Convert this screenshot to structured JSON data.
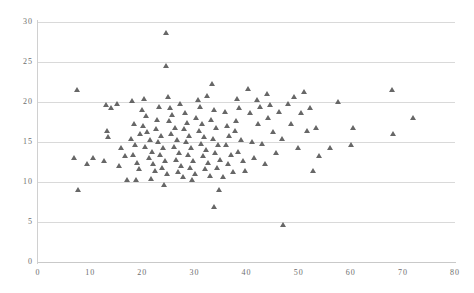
{
  "chart_data": {
    "type": "scatter",
    "title": "",
    "xlabel": "",
    "ylabel": "",
    "xlim": [
      0,
      80
    ],
    "ylim": [
      0,
      30
    ],
    "xticks": [
      0,
      10,
      20,
      30,
      40,
      50,
      60,
      70,
      80
    ],
    "yticks": [
      0,
      5,
      10,
      15,
      20,
      25,
      30
    ],
    "grid": "horizontal",
    "legend": "none",
    "marker": "triangle",
    "marker_color": "#5a5a5a",
    "gridline_color": "#d9d9d9",
    "axis_color": "#c9c9c9",
    "tick_label_color": "#6e6e6e",
    "series": [
      {
        "name": "observations",
        "points": [
          [
            7.5,
            21.5
          ],
          [
            7.0,
            13.0
          ],
          [
            9.4,
            12.3
          ],
          [
            10.6,
            13.0
          ],
          [
            7.6,
            9.0
          ],
          [
            13.0,
            19.6
          ],
          [
            14.0,
            19.2
          ],
          [
            13.2,
            16.4
          ],
          [
            13.4,
            15.6
          ],
          [
            12.6,
            12.6
          ],
          [
            15.2,
            19.8
          ],
          [
            16.0,
            14.2
          ],
          [
            16.6,
            13.2
          ],
          [
            15.6,
            12.0
          ],
          [
            17.0,
            10.2
          ],
          [
            18.0,
            20.1
          ],
          [
            18.4,
            17.2
          ],
          [
            17.8,
            15.4
          ],
          [
            18.6,
            14.6
          ],
          [
            18.2,
            13.4
          ],
          [
            19.0,
            12.4
          ],
          [
            19.4,
            11.6
          ],
          [
            18.8,
            10.2
          ],
          [
            19.6,
            16.0
          ],
          [
            20.0,
            19.0
          ],
          [
            20.4,
            20.4
          ],
          [
            20.8,
            18.2
          ],
          [
            20.2,
            17.0
          ],
          [
            21.0,
            16.2
          ],
          [
            21.4,
            15.2
          ],
          [
            20.6,
            14.4
          ],
          [
            21.8,
            13.8
          ],
          [
            21.2,
            13.0
          ],
          [
            22.0,
            12.2
          ],
          [
            22.4,
            11.4
          ],
          [
            21.6,
            10.4
          ],
          [
            22.8,
            17.8
          ],
          [
            23.2,
            19.4
          ],
          [
            22.6,
            16.6
          ],
          [
            23.6,
            15.8
          ],
          [
            23.0,
            15.0
          ],
          [
            24.0,
            14.2
          ],
          [
            23.4,
            13.4
          ],
          [
            24.4,
            12.6
          ],
          [
            23.8,
            11.8
          ],
          [
            24.8,
            11.0
          ],
          [
            24.2,
            9.6
          ],
          [
            24.6,
            28.6
          ],
          [
            24.6,
            24.5
          ],
          [
            25.0,
            20.6
          ],
          [
            25.4,
            19.2
          ],
          [
            25.8,
            18.4
          ],
          [
            25.2,
            17.6
          ],
          [
            26.2,
            16.8
          ],
          [
            25.6,
            16.0
          ],
          [
            26.6,
            15.2
          ],
          [
            26.0,
            14.4
          ],
          [
            27.0,
            13.6
          ],
          [
            26.4,
            12.8
          ],
          [
            27.4,
            12.0
          ],
          [
            26.8,
            11.2
          ],
          [
            27.8,
            10.6
          ],
          [
            27.2,
            19.8
          ],
          [
            28.2,
            18.6
          ],
          [
            28.6,
            17.4
          ],
          [
            28.0,
            16.6
          ],
          [
            29.0,
            15.8
          ],
          [
            28.4,
            15.0
          ],
          [
            29.4,
            14.2
          ],
          [
            28.8,
            13.4
          ],
          [
            29.8,
            12.6
          ],
          [
            29.2,
            11.8
          ],
          [
            30.2,
            11.0
          ],
          [
            29.6,
            10.2
          ],
          [
            30.6,
            20.3
          ],
          [
            31.0,
            19.4
          ],
          [
            30.4,
            18.0
          ],
          [
            31.4,
            17.2
          ],
          [
            30.8,
            16.4
          ],
          [
            31.8,
            15.6
          ],
          [
            31.2,
            14.8
          ],
          [
            32.2,
            14.0
          ],
          [
            31.6,
            13.2
          ],
          [
            32.6,
            12.4
          ],
          [
            32.0,
            11.6
          ],
          [
            33.0,
            10.8
          ],
          [
            32.4,
            20.8
          ],
          [
            33.4,
            22.2
          ],
          [
            33.8,
            19.0
          ],
          [
            33.2,
            17.8
          ],
          [
            34.2,
            16.8
          ],
          [
            33.6,
            15.4
          ],
          [
            34.6,
            14.6
          ],
          [
            34.0,
            13.6
          ],
          [
            35.0,
            12.8
          ],
          [
            34.4,
            11.8
          ],
          [
            35.4,
            10.6
          ],
          [
            34.8,
            9.0
          ],
          [
            33.8,
            6.9
          ],
          [
            35.8,
            18.8
          ],
          [
            36.2,
            17.0
          ],
          [
            36.6,
            15.8
          ],
          [
            36.0,
            14.6
          ],
          [
            37.0,
            13.4
          ],
          [
            36.4,
            12.2
          ],
          [
            37.4,
            11.2
          ],
          [
            37.8,
            16.4
          ],
          [
            38.2,
            20.4
          ],
          [
            38.6,
            19.2
          ],
          [
            38.0,
            17.6
          ],
          [
            39.0,
            15.2
          ],
          [
            38.4,
            13.8
          ],
          [
            39.4,
            12.6
          ],
          [
            39.8,
            11.4
          ],
          [
            40.2,
            21.6
          ],
          [
            40.6,
            18.6
          ],
          [
            41.0,
            15.0
          ],
          [
            41.4,
            13.0
          ],
          [
            42.0,
            20.2
          ],
          [
            42.6,
            19.4
          ],
          [
            42.2,
            17.2
          ],
          [
            43.0,
            14.8
          ],
          [
            43.6,
            12.2
          ],
          [
            44.0,
            21.0
          ],
          [
            44.6,
            19.6
          ],
          [
            44.2,
            18.0
          ],
          [
            45.0,
            16.2
          ],
          [
            45.6,
            13.6
          ],
          [
            46.2,
            18.8
          ],
          [
            46.8,
            15.4
          ],
          [
            47.0,
            4.6
          ],
          [
            48.0,
            19.8
          ],
          [
            48.6,
            17.2
          ],
          [
            49.2,
            20.6
          ],
          [
            49.8,
            14.2
          ],
          [
            50.4,
            18.6
          ],
          [
            51.0,
            21.2
          ],
          [
            51.6,
            16.4
          ],
          [
            52.2,
            19.2
          ],
          [
            52.8,
            11.4
          ],
          [
            53.4,
            16.8
          ],
          [
            54.0,
            13.2
          ],
          [
            56.0,
            14.2
          ],
          [
            57.5,
            20.0
          ],
          [
            60.0,
            14.6
          ],
          [
            60.5,
            16.8
          ],
          [
            68.0,
            21.5
          ],
          [
            68.2,
            16.0
          ],
          [
            72.0,
            18.0
          ]
        ]
      }
    ]
  },
  "axes": {
    "origin_label": "0",
    "y_origin_label": "0"
  }
}
